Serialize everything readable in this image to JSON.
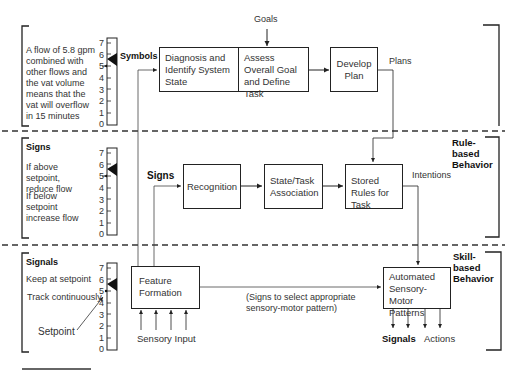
{
  "levels": {
    "knowledge": {
      "panel_text": "A flow of 5.8 gpm combined with other flows and the vat volume means that the vat will overflow in 15 minutes",
      "input_label": "Symbols",
      "goals_label": "Goals",
      "boxes": [
        {
          "id": "diagnosis",
          "label": "Diagnosis and Identify System State"
        },
        {
          "id": "assess",
          "label": "Assess Overall Goal and Define Task"
        },
        {
          "id": "plan",
          "label": "Develop Plan"
        }
      ],
      "output_label": "Plans"
    },
    "rule": {
      "title": "Rule-based Behavior",
      "panel_heading": "Signs",
      "panel_lines": [
        "If above setpoint, reduce flow",
        "If below setpoint increase flow"
      ],
      "input_label": "Signs",
      "boxes": [
        {
          "id": "recognition",
          "label": "Recognition"
        },
        {
          "id": "association",
          "label": "State/Task Association"
        },
        {
          "id": "stored",
          "label": "Stored Rules for Task"
        }
      ],
      "output_label": "Intentions"
    },
    "skill": {
      "title": "Skill-based Behavior",
      "panel_heading": "Signals",
      "panel_lines": [
        "Keep at setpoint",
        "Track continuously"
      ],
      "setpoint_label": "Setpoint",
      "boxes": [
        {
          "id": "feature",
          "label": "Feature Formation"
        },
        {
          "id": "automated",
          "label": "Automated Sensory-Motor Patterns"
        }
      ],
      "link_label": "(Signs to select appropriate sensory-motor pattern)",
      "input_label": "Sensory Input",
      "outputs": [
        "Signals",
        "Actions"
      ]
    }
  },
  "gauge": {
    "ticks": [
      "7",
      "6",
      "5",
      "4",
      "3",
      "2",
      "1",
      "0"
    ],
    "setpoint_value": 5,
    "current_value": 5.8
  },
  "colors": {
    "line": "#222222",
    "dashed": "#333333",
    "text": "#333333"
  }
}
